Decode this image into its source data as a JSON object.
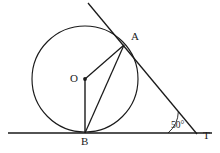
{
  "figure": {
    "background_color": "#ffffff",
    "stroke_color": "#1a1a1a",
    "label_color": "#1a1a1a"
  },
  "labels": {
    "center": "O",
    "tangent_point": "A",
    "bottom_point": "B",
    "apex_point": "T",
    "angle_value": "50°"
  },
  "geometry": {
    "circle": {
      "cx": 85,
      "cy": 79,
      "r": 53
    },
    "points": {
      "O": {
        "x": 85,
        "y": 79
      },
      "A": {
        "x": 124,
        "y": 45
      },
      "B": {
        "x": 85,
        "y": 133
      },
      "T": {
        "x": 197,
        "y": 134
      }
    },
    "segments": [
      {
        "name": "baseline",
        "x1": 8,
        "y1": 133,
        "x2": 212,
        "y2": 133
      },
      {
        "name": "tangent-line",
        "x1": 88,
        "y1": 3,
        "x2": 197,
        "y2": 134
      },
      {
        "name": "radius-OA",
        "x1": 85,
        "y1": 79,
        "x2": 124,
        "y2": 45
      },
      {
        "name": "radius-OB",
        "x1": 85,
        "y1": 79,
        "x2": 85,
        "y2": 133
      },
      {
        "name": "chord-AB",
        "x1": 124,
        "y1": 45,
        "x2": 85,
        "y2": 133
      }
    ],
    "angle_arc": {
      "cx": 197,
      "cy": 134,
      "r": 29,
      "start_deg": 180,
      "end_deg": 230
    }
  }
}
